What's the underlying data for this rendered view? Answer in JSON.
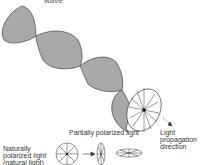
{
  "diagram": {
    "title_partial": "wave",
    "labels": {
      "propagation": [
        "Light",
        "propagation",
        "direction"
      ],
      "partially_polarized": "Partially polarized light",
      "natural": [
        "Naturally",
        "polarized light",
        "(natural light)"
      ]
    },
    "colors": {
      "wave_fill": "#a8a8a8",
      "stroke": "#444444",
      "text": "#333333"
    }
  }
}
